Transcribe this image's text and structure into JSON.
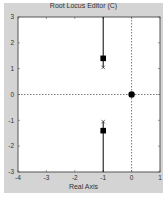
{
  "chart_data": {
    "type": "scatter",
    "title": "Root Locus Editor (C)",
    "xlabel": "Real Axis",
    "ylabel": "",
    "xlim": [
      -4,
      1
    ],
    "ylim": [
      -3,
      3
    ],
    "xticks": [
      -4,
      -3,
      -2,
      -1,
      0,
      1
    ],
    "yticks": [
      -3,
      -2,
      -1,
      0,
      1,
      2,
      3
    ],
    "grid": false,
    "reference_lines": {
      "x": 0,
      "y": 0,
      "style": "dotted"
    },
    "series": [
      {
        "name": "locus-upper-branch",
        "kind": "line",
        "points": [
          [
            -1,
            1.05
          ],
          [
            -1,
            3
          ]
        ]
      },
      {
        "name": "locus-lower-branch",
        "kind": "line",
        "points": [
          [
            -1,
            -1.05
          ],
          [
            -1,
            -3
          ]
        ]
      },
      {
        "name": "open-loop-poles",
        "kind": "marker",
        "marker": "x",
        "points": [
          [
            -1,
            1.05
          ],
          [
            -1,
            -1.05
          ]
        ]
      },
      {
        "name": "closed-loop-poles",
        "kind": "marker",
        "marker": "square",
        "points": [
          [
            -1,
            1.4
          ],
          [
            -1,
            -1.4
          ]
        ]
      },
      {
        "name": "compensator-pole",
        "kind": "marker",
        "marker": "circle-filled",
        "points": [
          [
            0,
            0
          ]
        ]
      }
    ]
  },
  "colors": {
    "panel": "#d4d4d4",
    "plot_bg": "#ffffff",
    "axis": "#555555",
    "locus": "#000000"
  }
}
